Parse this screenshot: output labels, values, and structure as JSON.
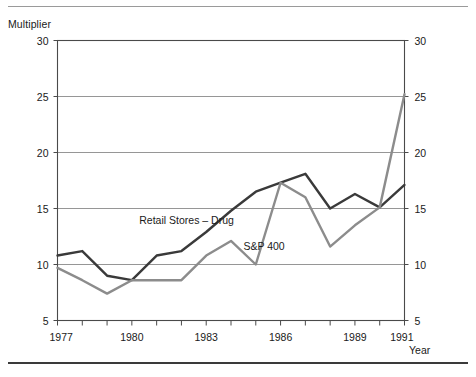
{
  "chart_data": {
    "type": "line",
    "title": "",
    "xlabel": "Year",
    "ylabel": "Multiplier",
    "x": [
      1977,
      1978,
      1979,
      1980,
      1981,
      1982,
      1983,
      1984,
      1985,
      1986,
      1987,
      1988,
      1989,
      1990,
      1991
    ],
    "xlim": [
      1977,
      1991
    ],
    "ylim": [
      5,
      30
    ],
    "xticks": [
      1977,
      1978,
      1979,
      1980,
      1981,
      1982,
      1983,
      1984,
      1985,
      1986,
      1987,
      1988,
      1989,
      1990,
      1991
    ],
    "xticklabels": [
      "1977",
      "",
      "",
      "1980",
      "",
      "",
      "1983",
      "",
      "",
      "1986",
      "",
      "",
      "1989",
      "",
      "1991"
    ],
    "yticks": [
      5,
      10,
      15,
      20,
      25,
      30
    ],
    "yticklabels": [
      "5",
      "10",
      "15",
      "20",
      "25",
      "30"
    ],
    "yticklabels_right": [
      "5",
      "10",
      "15",
      "20",
      "25",
      "30"
    ],
    "grid": "horizontal",
    "legend": "inline-annotations",
    "series": [
      {
        "name": "Retail Stores – Drug",
        "color": "#3a3a3a",
        "width": 2.4,
        "values": [
          10.8,
          11.2,
          9.0,
          8.6,
          10.8,
          11.2,
          12.9,
          14.8,
          16.5,
          17.3,
          18.1,
          15.0,
          16.3,
          15.1,
          17.1
        ],
        "label_x": 1980.3,
        "label_y": 13.6
      },
      {
        "name": "S&P 400",
        "color": "#8c8c8c",
        "width": 2.4,
        "values": [
          9.7,
          8.6,
          7.4,
          8.6,
          8.6,
          8.6,
          10.8,
          12.1,
          10.0,
          17.3,
          16.0,
          11.6,
          13.5,
          15.1,
          25.2
        ],
        "label_x": 1984.5,
        "label_y": 11.3
      }
    ]
  },
  "axis_labels": {
    "y_title": "Multiplier",
    "x_title": "Year"
  },
  "colors": {
    "frame": "#4a4a4a",
    "gridline": "#8a8a8a",
    "retail_line": "#3a3a3a",
    "sp400_line": "#8c8c8c",
    "rule_top": "#9a9a9a",
    "rule_bottom": "#3a3a3a"
  }
}
